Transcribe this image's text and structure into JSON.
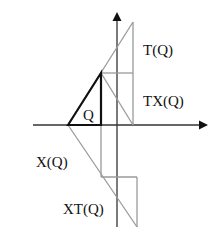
{
  "diagram": {
    "labels": {
      "t": "T(Q)",
      "tx": "TX(Q)",
      "q": "Q",
      "x": "X(Q)",
      "xt": "XT(Q)"
    },
    "colors": {
      "axis": "#333333",
      "shape_q": "#111111",
      "transform_lines": "#9a9a9a"
    }
  }
}
